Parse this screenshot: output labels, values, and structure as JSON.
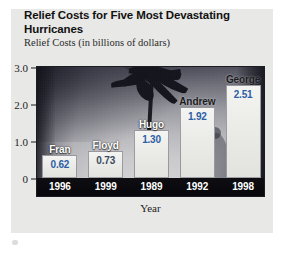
{
  "card": {
    "title": "Relief Costs for Five Most Devastating Hurricanes",
    "subtitle": "Relief Costs (in billions of dollars)"
  },
  "chart_data": {
    "type": "bar",
    "title": "Relief Costs for Five Most Devastating Hurricanes",
    "subtitle": "Relief Costs (in billions of dollars)",
    "xlabel": "Year",
    "ylabel": "Relief Costs (in billions of dollars)",
    "ylim": [
      0,
      3.0
    ],
    "yticks": [
      "0",
      "1.0",
      "2.0",
      "3.0"
    ],
    "ytick_values": [
      0,
      1.0,
      2.0,
      3.0
    ],
    "grid": false,
    "legend": "none",
    "categories": [
      "1996",
      "1999",
      "1989",
      "1992",
      "1998"
    ],
    "values": [
      0.62,
      0.73,
      1.3,
      1.92,
      2.51
    ],
    "value_labels": [
      "0.62",
      "0.73",
      "1.30",
      "1.92",
      "2.51"
    ],
    "point_names": [
      "Fran",
      "Floyd",
      "Hugo",
      "Andrew",
      "George"
    ],
    "bars": [
      {
        "name": "Fran",
        "year": "1996",
        "value": 0.62,
        "value_label": "0.62",
        "name_style": "light",
        "value_style": "blue"
      },
      {
        "name": "Floyd",
        "year": "1999",
        "value": 0.73,
        "value_label": "0.73",
        "name_style": "light",
        "value_style": "slate"
      },
      {
        "name": "Hugo",
        "year": "1989",
        "value": 1.3,
        "value_label": "1.30",
        "name_style": "light",
        "value_style": "blue"
      },
      {
        "name": "Andrew",
        "year": "1992",
        "value": 1.92,
        "value_label": "1.92",
        "name_style": "dark",
        "value_style": "blue"
      },
      {
        "name": "George",
        "year": "1998",
        "value": 2.51,
        "value_label": "2.51",
        "name_style": "dark",
        "value_style": "blue"
      }
    ],
    "background_image": "hurricane-palm-tree-photo",
    "colors": {
      "value_blue": "#2c5ea6",
      "value_slate": "#3a4a60",
      "bar_fill": "#efefec",
      "axis_strip": "#0b0b10",
      "card_background": "#e8e8e6"
    }
  }
}
